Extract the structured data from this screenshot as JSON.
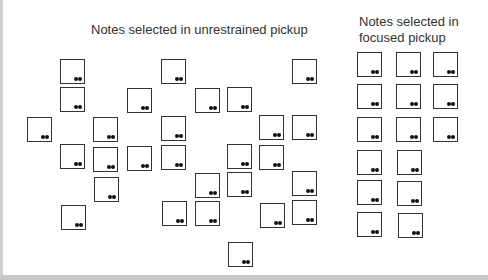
{
  "titles": {
    "unrestrained": "Notes selected in unrestrained pickup",
    "focused_line1": "Notes selected in",
    "focused_line2": "focused pickup"
  },
  "unrestrained_notes": [
    [
      60,
      59
    ],
    [
      161,
      59
    ],
    [
      292,
      59
    ],
    [
      60,
      87
    ],
    [
      127,
      88
    ],
    [
      195,
      88
    ],
    [
      227,
      87
    ],
    [
      27,
      117
    ],
    [
      93,
      117
    ],
    [
      161,
      116
    ],
    [
      259,
      115
    ],
    [
      292,
      115
    ],
    [
      60,
      144
    ],
    [
      93,
      147
    ],
    [
      127,
      146
    ],
    [
      161,
      145
    ],
    [
      227,
      144
    ],
    [
      259,
      145
    ],
    [
      195,
      173
    ],
    [
      227,
      172
    ],
    [
      292,
      171
    ],
    [
      94,
      177
    ],
    [
      61,
      205
    ],
    [
      162,
      201
    ],
    [
      195,
      201
    ],
    [
      260,
      203
    ],
    [
      292,
      200
    ],
    [
      228,
      242
    ]
  ],
  "focused_notes": [
    [
      357,
      52
    ],
    [
      396,
      52
    ],
    [
      433,
      52
    ],
    [
      357,
      84
    ],
    [
      396,
      84
    ],
    [
      433,
      84
    ],
    [
      357,
      117
    ],
    [
      396,
      117
    ],
    [
      433,
      117
    ],
    [
      357,
      150
    ],
    [
      397,
      150
    ],
    [
      357,
      180
    ],
    [
      397,
      181
    ],
    [
      357,
      212
    ],
    [
      398,
      213
    ]
  ]
}
